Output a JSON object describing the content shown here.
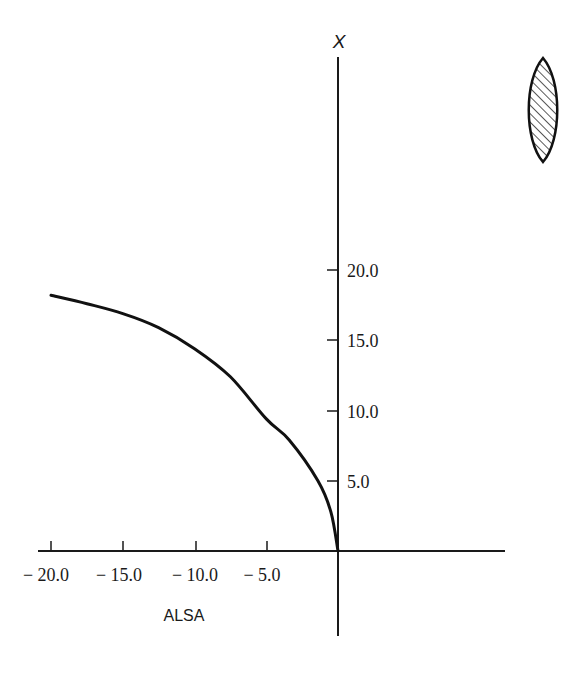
{
  "chart_data": {
    "type": "line",
    "title": "",
    "xlabel": "ALSA",
    "ylabel": "X",
    "xlim": [
      -20.0,
      10.0
    ],
    "ylim": [
      -6.0,
      35.0
    ],
    "grid": false,
    "legend": null,
    "x_ticks": [
      -20.0,
      -15.0,
      -10.0,
      -5.0
    ],
    "x_tick_labels": [
      "− 20.0",
      "− 15.0",
      "− 10.0",
      "− 5.0"
    ],
    "y_ticks": [
      5.0,
      10.0,
      15.0,
      20.0
    ],
    "y_tick_labels": [
      "5.0",
      "10.0",
      "15.0",
      "20.0"
    ],
    "series": [
      {
        "name": "X vs ALSA",
        "x": [
          -20.0,
          -17.5,
          -15.0,
          -12.5,
          -10.0,
          -7.5,
          -5.0,
          -3.4,
          -1.4,
          -0.5,
          0.0
        ],
        "y": [
          18.2,
          17.6,
          16.9,
          15.9,
          14.4,
          12.4,
          9.4,
          7.9,
          5.0,
          2.8,
          0.0
        ]
      }
    ],
    "annotations": [
      {
        "type": "icon",
        "name": "hatched-biconvex-lens",
        "position": "top-right"
      }
    ]
  },
  "labels": {
    "x_axis": "ALSA",
    "y_axis": "X"
  },
  "colors": {
    "ink": "#1a1a1a",
    "background": "#ffffff"
  }
}
